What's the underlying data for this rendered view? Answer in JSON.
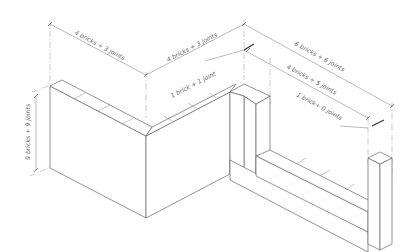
{
  "diagram": {
    "type": "isometric-brick-wall-dimensioning",
    "dimensions": {
      "left_wall_length": "4 bricks + 3 joints",
      "right_wall_length": "4 bricks + 3 joints",
      "wall_height": "9 bricks + 9 joints",
      "pier_projection": "1 brick + 1 joint",
      "low_wall_total": "6 bricks + 6 joints",
      "low_wall_opening": "4 bricks + 5 joints",
      "end_pier_width": "1 brick+ 0 joints"
    },
    "colors": {
      "line": "#777777",
      "text": "#666666",
      "background": "#ffffff"
    }
  }
}
